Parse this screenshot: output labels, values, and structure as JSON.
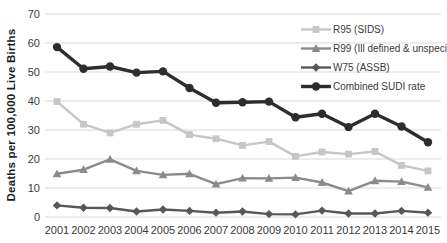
{
  "chart_data": {
    "type": "line",
    "title": "",
    "xlabel": "",
    "ylabel": "Deaths per 100,000 Live Births",
    "ylim": [
      0,
      70
    ],
    "ytick_step": 10,
    "grid": true,
    "legend_position": "top-right-inside",
    "categories": [
      "2001",
      "2002",
      "2003",
      "2004",
      "2005",
      "2006",
      "2007",
      "2008",
      "2009",
      "2010",
      "2011",
      "2012",
      "2013",
      "2014",
      "2015"
    ],
    "series": [
      {
        "id": "r95-sids",
        "name": "R95 (SIDS)",
        "marker": "square",
        "color": "#c6c6c6",
        "line_width": 2.4,
        "values": [
          39.8,
          32.0,
          29.0,
          32.0,
          33.3,
          28.4,
          27.0,
          24.7,
          26.0,
          20.9,
          22.4,
          21.7,
          22.6,
          17.8,
          15.9
        ]
      },
      {
        "id": "r99-ill-defined",
        "name": "R99 (Ill defined & unspecified)",
        "marker": "triangle",
        "color": "#8b8b8b",
        "line_width": 2.4,
        "values": [
          14.9,
          16.3,
          19.9,
          15.9,
          14.5,
          14.9,
          11.3,
          13.4,
          13.3,
          13.6,
          11.9,
          8.9,
          12.5,
          12.2,
          10.2
        ]
      },
      {
        "id": "w75-assb",
        "name": "W75 (ASSB)",
        "marker": "diamond",
        "color": "#575757",
        "line_width": 2.4,
        "values": [
          4.0,
          3.2,
          3.1,
          1.9,
          2.6,
          2.1,
          1.5,
          1.9,
          1.0,
          0.9,
          2.2,
          1.2,
          1.2,
          2.1,
          1.5
        ]
      },
      {
        "id": "combined-sudi",
        "name": "Combined SUDI rate",
        "marker": "circle",
        "color": "#2d2d2d",
        "line_width": 3.4,
        "values": [
          58.6,
          51.1,
          51.9,
          49.8,
          50.2,
          44.5,
          39.4,
          39.6,
          39.8,
          34.4,
          35.6,
          31.0,
          35.6,
          31.2,
          25.8
        ]
      }
    ]
  },
  "colors": {
    "background": "#ffffff",
    "gridline": "#d9d9d9",
    "tick_label": "#3a3a3a"
  }
}
